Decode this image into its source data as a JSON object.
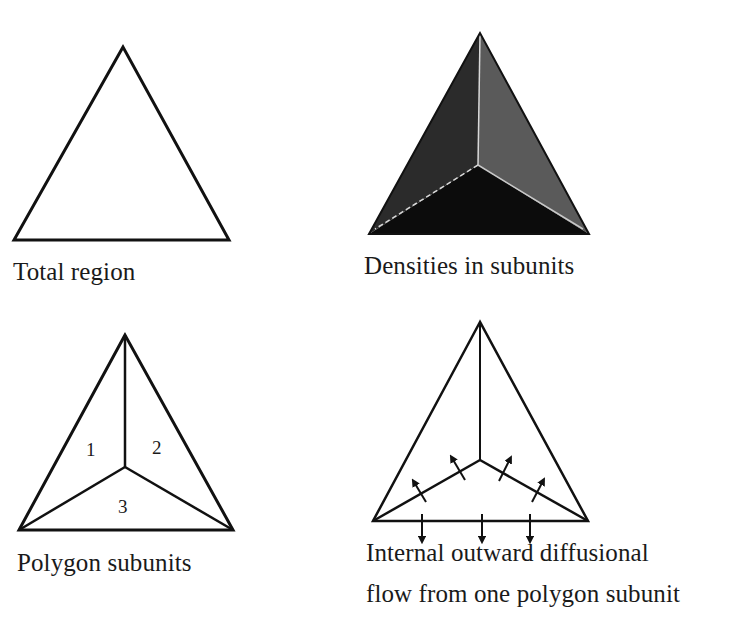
{
  "panels": [
    {
      "id": "total-region",
      "caption": "Total region"
    },
    {
      "id": "densities",
      "caption": "Densities in subunits",
      "colors": {
        "left_subunit": "#2b2b2b",
        "right_subunit": "#5a5a5a",
        "bottom_subunit": "#0c0c0c",
        "divider": "#d8d8d8"
      }
    },
    {
      "id": "polygon-subunits",
      "caption": "Polygon subunits",
      "labels": [
        "1",
        "2",
        "3"
      ]
    },
    {
      "id": "diffusional-flow",
      "caption_line1": "Internal outward diffusional",
      "caption_line2": "flow from one polygon subunit",
      "arrows_up": 4,
      "arrows_down": 3
    }
  ]
}
